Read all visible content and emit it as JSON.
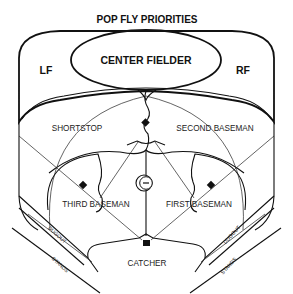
{
  "diagram": {
    "title": "POP FLY PRIORITIES",
    "zones": {
      "center_fielder": "CENTER FIELDER",
      "left_fielder": "LF",
      "right_fielder": "RF",
      "shortstop": "SHORTSTOP",
      "second_baseman": "SECOND BASEMAN",
      "third_baseman": "THIRD BASEMAN",
      "first_baseman": "FIRST BASEMAN",
      "catcher": "CATCHER"
    },
    "areas": {
      "left_dugout": "DUGOUT",
      "left_stands": "STANDS",
      "right_dugout": "DUGOUT",
      "right_stands": "STANDS"
    },
    "markers": {
      "second_base": "second-base",
      "third_base": "third-base",
      "first_base": "first-base",
      "pitchers_mound": "pitchers-mound",
      "home_plate": "home-plate"
    },
    "colors": {
      "line": "#111111",
      "background": "#ffffff"
    }
  }
}
